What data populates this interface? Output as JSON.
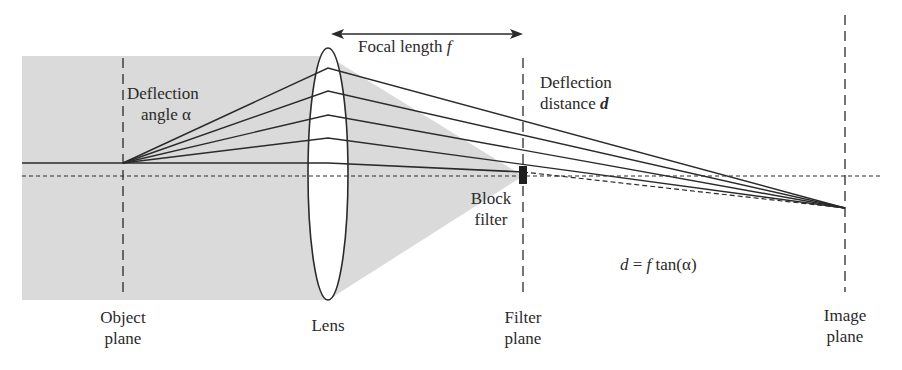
{
  "labels": {
    "focal_length": "Focal length",
    "focal_symbol": "f",
    "deflection_angle_line1": "Deflection",
    "deflection_angle_line2": "angle α",
    "deflection_distance_line1": "Deflection",
    "deflection_distance_line2": "distance",
    "deflection_symbol": "d",
    "block_filter_line1": "Block",
    "block_filter_line2": "filter",
    "equation_d": "d",
    "equation_eq": " = ",
    "equation_f": "f",
    "equation_rest": " tan(α)",
    "object_plane_line1": "Object",
    "object_plane_line2": "plane",
    "lens": "Lens",
    "filter_plane_line1": "Filter",
    "filter_plane_line2": "plane",
    "image_plane_line1": "Image",
    "image_plane_line2": "plane"
  },
  "colors": {
    "shade": "#d9d9d9",
    "line": "#2a2a2a",
    "background": "#ffffff"
  }
}
